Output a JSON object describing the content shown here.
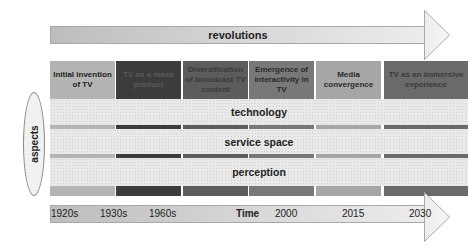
{
  "revolutions_arrow": {
    "label": "revolutions"
  },
  "columns": [
    {
      "label": "Initial invention of TV",
      "color": "#b4b4b4",
      "text_color": "#222222"
    },
    {
      "label": "TV as a mass product",
      "color": "#3c3c3c",
      "text_color": "#5a5a5a"
    },
    {
      "label": "Diversification of broadcast TV content",
      "color": "#5c5c5c",
      "text_color": "#3a3a3a"
    },
    {
      "label": "Emergence of interactivity in TV",
      "color": "#787878",
      "text_color": "#2a2a2a"
    },
    {
      "label": "Media convergence",
      "color": "#a6a6a6",
      "text_color": "#2a2a2a"
    },
    {
      "label": "TV as an immersive experience",
      "color": "#6a6a6a",
      "text_color": "#3a3a3a"
    }
  ],
  "aspects": {
    "label": "aspects",
    "bands": [
      {
        "label": "technology"
      },
      {
        "label": "service space"
      },
      {
        "label": "perception"
      }
    ]
  },
  "time_axis": {
    "label": "Time",
    "ticks": [
      "1920s",
      "1930s",
      "1960s",
      "2000",
      "2015",
      "2030"
    ]
  }
}
